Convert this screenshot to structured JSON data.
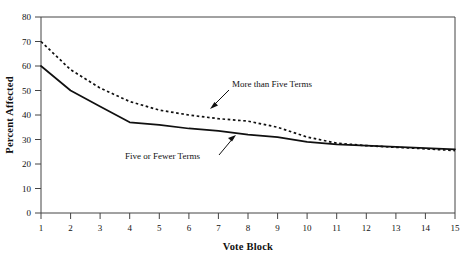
{
  "chart_data": {
    "type": "line",
    "title": "",
    "xlabel": "Vote Block",
    "ylabel": "Percent Affected",
    "x": [
      1,
      2,
      3,
      4,
      5,
      6,
      7,
      8,
      9,
      10,
      11,
      12,
      13,
      14,
      15
    ],
    "xlim": [
      1,
      15
    ],
    "ylim": [
      0,
      80
    ],
    "ytick_labels": [
      "0",
      "10",
      "20",
      "30",
      "40",
      "50",
      "60",
      "70",
      "80"
    ],
    "yticks": [
      0,
      10,
      20,
      30,
      40,
      50,
      60,
      70,
      80
    ],
    "xtick_labels": [
      "1",
      "2",
      "3",
      "4",
      "5",
      "6",
      "7",
      "8",
      "9",
      "10",
      "11",
      "12",
      "13",
      "14",
      "15"
    ],
    "grid": false,
    "legend_position": "inline-annotations",
    "series": [
      {
        "name": "More than Five Terms",
        "style": "dotted",
        "values": [
          70.0,
          58.5,
          51.0,
          45.5,
          42.0,
          40.0,
          38.5,
          37.5,
          35.0,
          31.0,
          28.5,
          27.5,
          26.8,
          26.2,
          25.5
        ]
      },
      {
        "name": "Five or Fewer Terms",
        "style": "solid",
        "values": [
          60.0,
          50.0,
          43.5,
          37.0,
          36.0,
          34.5,
          33.5,
          32.0,
          31.0,
          29.0,
          28.0,
          27.5,
          27.0,
          26.5,
          26.0
        ]
      }
    ],
    "annotations": [
      {
        "text": "More than Five Terms",
        "label_x": 7.6,
        "label_y": 48.5,
        "point_x": 6.6,
        "point_y": 40.5
      },
      {
        "text": "Five or Fewer Terms",
        "label_x": 3.9,
        "label_y": 22.5,
        "point_x": 7.3,
        "point_y": 33.8
      }
    ]
  }
}
